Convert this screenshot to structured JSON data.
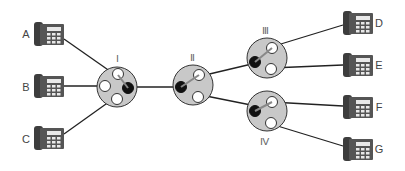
{
  "diagram": {
    "phones": [
      {
        "id": "A",
        "label": "A",
        "x": 34,
        "y": 22,
        "label_side": "left"
      },
      {
        "id": "B",
        "label": "B",
        "x": 34,
        "y": 74,
        "label_side": "left"
      },
      {
        "id": "C",
        "label": "C",
        "x": 34,
        "y": 126,
        "label_side": "left"
      },
      {
        "id": "D",
        "label": "D",
        "x": 343,
        "y": 11,
        "label_side": "right"
      },
      {
        "id": "E",
        "label": "E",
        "x": 343,
        "y": 53,
        "label_side": "right"
      },
      {
        "id": "F",
        "label": "F",
        "x": 343,
        "y": 95,
        "label_side": "right"
      },
      {
        "id": "G",
        "label": "G",
        "x": 343,
        "y": 137,
        "label_side": "right"
      }
    ],
    "switches": [
      {
        "id": "I",
        "label": "Ⅰ",
        "cx": 117,
        "cy": 87,
        "label_pos": "top"
      },
      {
        "id": "II",
        "label": "Ⅱ",
        "cx": 193,
        "cy": 85,
        "label_pos": "top"
      },
      {
        "id": "III",
        "label": "Ⅲ",
        "cx": 267,
        "cy": 58,
        "label_pos": "top"
      },
      {
        "id": "IV",
        "label": "Ⅳ",
        "cx": 267,
        "cy": 111,
        "label_pos": "bottom"
      }
    ],
    "connections": [
      {
        "from": "A",
        "to": "I"
      },
      {
        "from": "B",
        "to": "I"
      },
      {
        "from": "C",
        "to": "I"
      },
      {
        "from": "I",
        "to": "II"
      },
      {
        "from": "II",
        "to": "III"
      },
      {
        "from": "II",
        "to": "IV"
      },
      {
        "from": "III",
        "to": "D"
      },
      {
        "from": "III",
        "to": "E"
      },
      {
        "from": "IV",
        "to": "F"
      },
      {
        "from": "IV",
        "to": "G"
      }
    ],
    "colors": {
      "switch_fill": "#c8c8c8",
      "switch_stroke": "#333333",
      "phone_body": "#4a4a4a",
      "line": "#222222",
      "active_port": "#111111"
    }
  }
}
